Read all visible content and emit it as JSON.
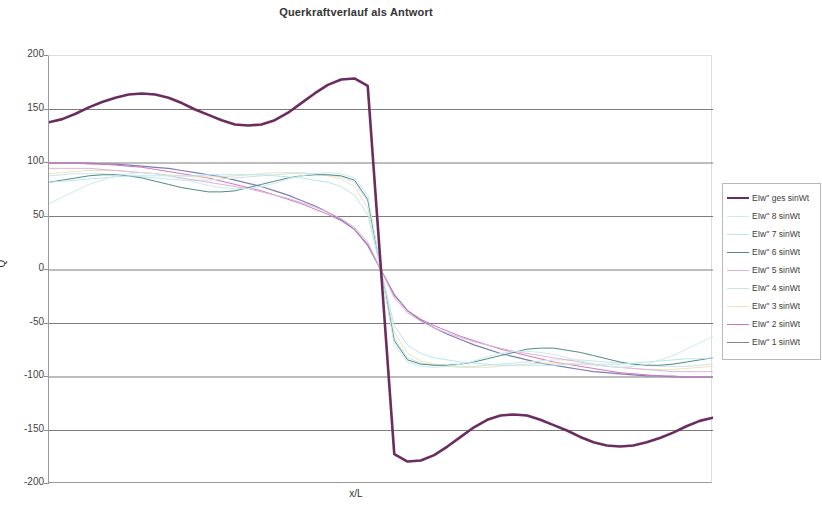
{
  "chart_data": {
    "type": "line",
    "title": "Querkraftverlauf als Antwort",
    "xlabel": "x/L",
    "ylabel": "Q",
    "ylim": [
      -200,
      200
    ],
    "xlim": [
      0,
      1
    ],
    "yticks": [
      200,
      150,
      100,
      50,
      0,
      -50,
      -100,
      -150,
      -200
    ],
    "ytick_labels": [
      "200",
      "150",
      "100",
      "50",
      "0",
      "-50",
      "-100",
      "-150",
      "-200"
    ],
    "grid": "horizontal",
    "legend_position": "right",
    "x": [
      0,
      0.02,
      0.04,
      0.06,
      0.08,
      0.1,
      0.12,
      0.14,
      0.16,
      0.18,
      0.2,
      0.22,
      0.24,
      0.26,
      0.28,
      0.3,
      0.32,
      0.34,
      0.36,
      0.38,
      0.4,
      0.42,
      0.44,
      0.46,
      0.48,
      0.5,
      0.52,
      0.54,
      0.56,
      0.58,
      0.6,
      0.62,
      0.64,
      0.66,
      0.68,
      0.7,
      0.72,
      0.74,
      0.76,
      0.78,
      0.8,
      0.82,
      0.84,
      0.86,
      0.88,
      0.9,
      0.92,
      0.94,
      0.96,
      0.98,
      1
    ],
    "series": [
      {
        "name": "EIw'' ges sinWt",
        "color": "#6b2c5f",
        "width": 2.6,
        "values": [
          138,
          141,
          146,
          152,
          157,
          161,
          164,
          165,
          164,
          161,
          156,
          150,
          145,
          140,
          136,
          135,
          136,
          140,
          147,
          156,
          165,
          173,
          178,
          179,
          172,
          0,
          -172,
          -179,
          -178,
          -173,
          -165,
          -156,
          -147,
          -140,
          -136,
          -135,
          -136,
          -140,
          -145,
          -150,
          -156,
          -161,
          -164,
          -165,
          -164,
          -161,
          -157,
          -152,
          -146,
          -141,
          -138
        ]
      },
      {
        "name": "EIw'' 8 sinWt",
        "color": "#cfe9ee",
        "width": 1,
        "values": [
          62,
          68,
          74,
          80,
          84,
          88,
          90,
          91,
          90,
          88,
          85,
          82,
          79,
          77,
          76,
          76,
          78,
          81,
          85,
          88,
          90,
          91,
          90,
          86,
          70,
          0,
          -70,
          -86,
          -90,
          -91,
          -90,
          -88,
          -85,
          -81,
          -78,
          -76,
          -76,
          -77,
          -79,
          -82,
          -85,
          -88,
          -90,
          -91,
          -90,
          -88,
          -84,
          -80,
          -74,
          -68,
          -62
        ]
      },
      {
        "name": "EIw'' 7 sinWt",
        "color": "#b8e6ef",
        "width": 1,
        "values": [
          82,
          83,
          84,
          85,
          86,
          87,
          88,
          88,
          88,
          88,
          88,
          88,
          89,
          89,
          89,
          89,
          89,
          88,
          87,
          86,
          84,
          82,
          78,
          70,
          52,
          0,
          -52,
          -70,
          -78,
          -82,
          -84,
          -86,
          -87,
          -88,
          -89,
          -89,
          -89,
          -89,
          -89,
          -88,
          -88,
          -88,
          -88,
          -88,
          -87,
          -86,
          -85,
          -84,
          -83,
          -83,
          -82
        ]
      },
      {
        "name": "EIw'' 6 sinWt",
        "color": "#4e8b82",
        "width": 1,
        "values": [
          82,
          84,
          86,
          88,
          89,
          89,
          88,
          86,
          83,
          80,
          77,
          75,
          73,
          73,
          74,
          77,
          80,
          83,
          86,
          88,
          89,
          89,
          88,
          84,
          66,
          0,
          -66,
          -84,
          -88,
          -89,
          -89,
          -88,
          -86,
          -83,
          -80,
          -77,
          -74,
          -73,
          -73,
          -75,
          -77,
          -80,
          -83,
          -86,
          -88,
          -89,
          -89,
          -88,
          -86,
          -84,
          -82
        ]
      },
      {
        "name": "EIw'' 5 sinWt",
        "color": "#d9b6d6",
        "width": 1,
        "values": [
          95,
          95,
          95,
          95,
          94,
          93,
          92,
          91,
          90,
          88,
          86,
          84,
          82,
          80,
          78,
          76,
          73,
          70,
          67,
          63,
          59,
          54,
          48,
          40,
          26,
          0,
          -26,
          -40,
          -48,
          -54,
          -59,
          -63,
          -67,
          -70,
          -73,
          -76,
          -78,
          -80,
          -82,
          -84,
          -86,
          -88,
          -90,
          -91,
          -92,
          -93,
          -94,
          -95,
          -95,
          -95,
          -95
        ]
      },
      {
        "name": "EIw'' 4 sinWt",
        "color": "#c9e4ea",
        "width": 1,
        "values": [
          88,
          89,
          90,
          90,
          90,
          89,
          88,
          87,
          86,
          85,
          84,
          84,
          84,
          85,
          86,
          87,
          88,
          89,
          90,
          90,
          90,
          89,
          87,
          82,
          64,
          0,
          -64,
          -82,
          -87,
          -89,
          -90,
          -90,
          -90,
          -89,
          -88,
          -87,
          -86,
          -85,
          -84,
          -84,
          -84,
          -85,
          -86,
          -87,
          -88,
          -89,
          -90,
          -90,
          -90,
          -89,
          -88
        ]
      },
      {
        "name": "EIw'' 3 sinWt",
        "color": "#efe3bb",
        "width": 1,
        "values": [
          90,
          91,
          92,
          93,
          93,
          93,
          92,
          91,
          90,
          89,
          88,
          87,
          87,
          87,
          88,
          89,
          90,
          91,
          91,
          91,
          90,
          88,
          85,
          78,
          58,
          0,
          -58,
          -78,
          -85,
          -88,
          -90,
          -91,
          -91,
          -91,
          -90,
          -89,
          -88,
          -87,
          -87,
          -87,
          -88,
          -89,
          -90,
          -91,
          -92,
          -93,
          -93,
          -93,
          -92,
          -91,
          -90
        ]
      },
      {
        "name": "EIw'' 2 sinWt",
        "color": "#d972c0",
        "width": 1,
        "values": [
          100,
          100,
          100,
          99,
          99,
          98,
          97,
          96,
          94,
          92,
          90,
          88,
          86,
          83,
          80,
          77,
          74,
          70,
          66,
          62,
          57,
          52,
          46,
          38,
          24,
          0,
          -24,
          -38,
          -46,
          -52,
          -57,
          -62,
          -66,
          -70,
          -74,
          -77,
          -80,
          -83,
          -86,
          -88,
          -90,
          -92,
          -94,
          -96,
          -97,
          -98,
          -99,
          -99,
          -100,
          -100,
          -100
        ]
      },
      {
        "name": "EIw'' 1 sinWt",
        "color": "#7b7fb5",
        "width": 1.2,
        "values": [
          100,
          100,
          100,
          100,
          99,
          99,
          98,
          97,
          96,
          95,
          93,
          91,
          89,
          87,
          84,
          81,
          78,
          74,
          70,
          65,
          60,
          54,
          47,
          38,
          23,
          0,
          -23,
          -38,
          -47,
          -54,
          -60,
          -65,
          -70,
          -74,
          -78,
          -81,
          -84,
          -87,
          -89,
          -91,
          -93,
          -95,
          -96,
          -97,
          -98,
          -99,
          -99,
          -100,
          -100,
          -100,
          -100
        ]
      }
    ]
  }
}
